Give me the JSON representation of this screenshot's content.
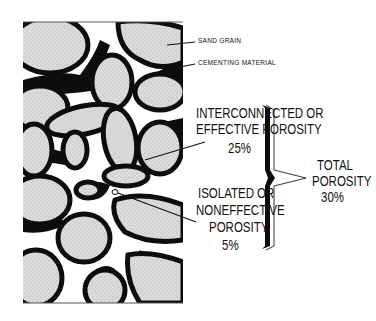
{
  "diagram": {
    "type": "porosity-cross-section",
    "labels": {
      "sand_grain": "SAND GRAIN",
      "cementing_material": "CEMENTING MATERIAL",
      "effective": {
        "line1": "INTERCONNECTED OR",
        "line2": "EFFECTIVE POROSITY",
        "value": "25%"
      },
      "isolated": {
        "line1": "ISOLATED OR",
        "line2": "NONEFFECTIVE",
        "line3": "POROSITY",
        "value": "5%"
      },
      "total": {
        "line1": "TOTAL",
        "line2": "POROSITY",
        "value": "30%"
      }
    },
    "colors": {
      "grain_fill": "#d9d9d9",
      "cement": "#0d0d0d",
      "pore": "#ffffff",
      "outline": "#333333"
    }
  }
}
